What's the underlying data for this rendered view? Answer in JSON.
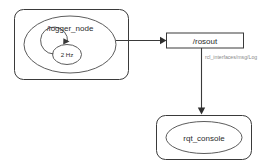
{
  "diagram": {
    "type": "ros-node-graph",
    "background_color": "#ffffff",
    "stroke_color": "#3a3a3a",
    "label_color": "#8a8a8a",
    "publisher_group": {
      "node_label": "/logger_node",
      "rate_label": "2 Hz",
      "loop_icon": "refresh-loop-icon"
    },
    "topic": {
      "label": "/rosout"
    },
    "message_type": {
      "label": "rcl_interfaces/msg/Log"
    },
    "subscriber_group": {
      "node_label": "rqt_console"
    }
  }
}
